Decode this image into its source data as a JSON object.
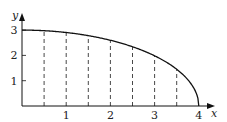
{
  "chart_data": {
    "type": "line",
    "title": "",
    "xlabel": "x",
    "ylabel": "y",
    "xlim": [
      0,
      4.2
    ],
    "ylim": [
      0,
      3.3
    ],
    "x_ticks": [
      "1",
      "2",
      "3",
      "4"
    ],
    "y_ticks": [
      "1",
      "2",
      "3"
    ],
    "grid": false,
    "legend": null,
    "series": [
      {
        "name": "curve",
        "equation": "y = 3*sqrt(1 - x^2/16)",
        "x": [
          0,
          0.5,
          1,
          1.5,
          2,
          2.5,
          3,
          3.5,
          4
        ],
        "y": [
          3.0,
          2.98,
          2.9,
          2.78,
          2.6,
          2.34,
          1.98,
          1.45,
          0
        ]
      }
    ],
    "dashed_verticals_x": [
      0.5,
      1,
      1.5,
      2,
      2.5,
      3,
      3.5
    ]
  },
  "axes": {
    "x_label": "x",
    "y_label": "y",
    "x_tick_labels": [
      "1",
      "2",
      "3",
      "4"
    ],
    "y_tick_labels": [
      "1",
      "2",
      "3"
    ]
  }
}
